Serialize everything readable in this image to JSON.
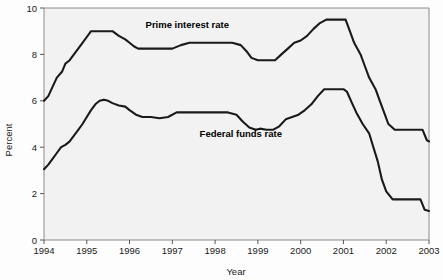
{
  "chart_data": {
    "type": "line",
    "title": "",
    "xlabel": "Year",
    "ylabel": "Percent",
    "xlim": [
      1994,
      2003
    ],
    "ylim": [
      0,
      10
    ],
    "ytick_labels": [
      "0",
      "2",
      "4",
      "6",
      "8",
      "10"
    ],
    "yticks": [
      0,
      2,
      4,
      6,
      8,
      10
    ],
    "xtick_labels": [
      "1994",
      "1995",
      "1996",
      "1997",
      "1998",
      "1999",
      "2000",
      "2001",
      "2002",
      "2003"
    ],
    "xticks": [
      1994,
      1995,
      1996,
      1997,
      1998,
      1999,
      2000,
      2001,
      2002,
      2003
    ],
    "grid": false,
    "legend_position": "inline-annotation",
    "plot_background": "#f2f2f2",
    "line_color": "#1a1a1a",
    "frame_color": "#8c8c8c",
    "annotations": [
      {
        "text": "Prime interest rate",
        "x": 1997.35,
        "y": 9.15
      },
      {
        "text": "Federal funds rate",
        "x": 1998.6,
        "y": 4.45
      }
    ],
    "series": [
      {
        "name": "Prime interest rate",
        "label": "Prime interest rate",
        "x": [
          1994.0,
          1994.1,
          1994.2,
          1994.3,
          1994.42,
          1994.5,
          1994.6,
          1994.7,
          1994.8,
          1994.9,
          1995.0,
          1995.1,
          1995.2,
          1995.3,
          1995.45,
          1995.6,
          1995.75,
          1995.9,
          1996.0,
          1996.1,
          1996.2,
          1996.3,
          1996.45,
          1996.6,
          1996.8,
          1997.0,
          1997.2,
          1997.4,
          1997.6,
          1997.8,
          1998.0,
          1998.2,
          1998.4,
          1998.6,
          1998.75,
          1998.85,
          1999.0,
          1999.2,
          1999.4,
          1999.55,
          1999.7,
          1999.85,
          2000.0,
          2000.15,
          2000.3,
          2000.45,
          2000.6,
          2000.75,
          2000.9,
          2001.0,
          2001.05,
          2001.15,
          2001.25,
          2001.4,
          2001.5,
          2001.6,
          2001.75,
          2001.85,
          2001.95,
          2002.05,
          2002.2,
          2002.5,
          2002.85,
          2002.95,
          2003.0
        ],
        "y": [
          6.0,
          6.2,
          6.6,
          7.0,
          7.25,
          7.6,
          7.75,
          8.0,
          8.25,
          8.5,
          8.75,
          9.0,
          9.0,
          9.0,
          9.0,
          9.0,
          8.8,
          8.65,
          8.5,
          8.35,
          8.25,
          8.25,
          8.25,
          8.25,
          8.25,
          8.25,
          8.4,
          8.5,
          8.5,
          8.5,
          8.5,
          8.5,
          8.5,
          8.4,
          8.1,
          7.85,
          7.75,
          7.75,
          7.75,
          8.0,
          8.25,
          8.5,
          8.6,
          8.8,
          9.1,
          9.35,
          9.5,
          9.5,
          9.5,
          9.5,
          9.5,
          9.0,
          8.5,
          8.0,
          7.5,
          7.0,
          6.5,
          6.0,
          5.5,
          5.0,
          4.75,
          4.75,
          4.75,
          4.3,
          4.25
        ]
      },
      {
        "name": "Federal funds rate",
        "label": "Federal funds rate",
        "x": [
          1994.0,
          1994.1,
          1994.2,
          1994.3,
          1994.4,
          1994.5,
          1994.6,
          1994.7,
          1994.8,
          1994.9,
          1995.0,
          1995.1,
          1995.2,
          1995.3,
          1995.4,
          1995.5,
          1995.6,
          1995.75,
          1995.9,
          1996.0,
          1996.15,
          1996.3,
          1996.5,
          1996.7,
          1996.9,
          1997.1,
          1997.3,
          1997.5,
          1997.7,
          1997.9,
          1998.1,
          1998.3,
          1998.5,
          1998.65,
          1998.8,
          1998.95,
          1999.05,
          1999.2,
          1999.35,
          1999.5,
          1999.65,
          1999.8,
          1999.95,
          2000.1,
          2000.25,
          2000.4,
          2000.55,
          2000.7,
          2000.85,
          2001.0,
          2001.08,
          2001.2,
          2001.3,
          2001.45,
          2001.6,
          2001.7,
          2001.8,
          2001.9,
          2002.0,
          2002.15,
          2002.4,
          2002.8,
          2002.9,
          2003.0
        ],
        "y": [
          3.05,
          3.25,
          3.5,
          3.75,
          4.0,
          4.1,
          4.25,
          4.5,
          4.75,
          5.0,
          5.3,
          5.6,
          5.85,
          6.0,
          6.05,
          6.0,
          5.9,
          5.8,
          5.75,
          5.6,
          5.4,
          5.3,
          5.3,
          5.25,
          5.3,
          5.5,
          5.5,
          5.5,
          5.5,
          5.5,
          5.5,
          5.5,
          5.4,
          5.1,
          4.85,
          4.75,
          4.8,
          4.75,
          4.75,
          4.9,
          5.2,
          5.3,
          5.4,
          5.6,
          5.85,
          6.2,
          6.5,
          6.5,
          6.5,
          6.5,
          6.4,
          5.9,
          5.5,
          5.0,
          4.6,
          4.0,
          3.4,
          2.6,
          2.1,
          1.75,
          1.75,
          1.75,
          1.3,
          1.25
        ]
      }
    ]
  }
}
